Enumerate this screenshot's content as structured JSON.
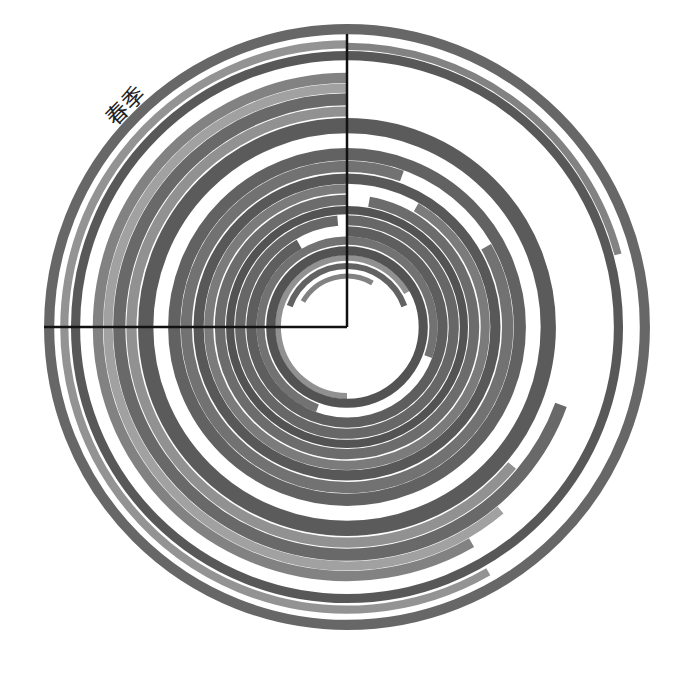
{
  "chart_data": {
    "type": "bar",
    "subtype": "radial-bar",
    "title": "",
    "angle_unit": "degrees",
    "angle_range": [
      0,
      360
    ],
    "direction": "clockwise",
    "start": "top",
    "radial_range": [
      0,
      30
    ],
    "angular_labels": [
      {
        "text": "春季",
        "angle": 315
      }
    ],
    "axes": {
      "vertical_axis_to_top": true,
      "horizontal_axis_to_left": true
    },
    "series": [
      {
        "name": "r1",
        "ring": 5,
        "width": 0.5,
        "start": 300,
        "end": 390,
        "gray": "#777777"
      },
      {
        "name": "r2",
        "ring": 6,
        "width": 0.6,
        "start": 290,
        "end": 430,
        "gray": "#555555"
      },
      {
        "name": "r3",
        "ring": 6.8,
        "width": 0.6,
        "start": 180,
        "end": 420,
        "gray": "#888888"
      },
      {
        "name": "r4",
        "ring": 7.5,
        "width": 0.9,
        "start": 0,
        "end": 360,
        "gray": "#444444"
      },
      {
        "name": "r5",
        "ring": 8.5,
        "width": 0.8,
        "start": 200,
        "end": 470,
        "gray": "#666666"
      },
      {
        "name": "r6",
        "ring": 9.4,
        "width": 1.0,
        "start": 0,
        "end": 330,
        "gray": "#505050"
      },
      {
        "name": "r7",
        "ring": 10.5,
        "width": 1.0,
        "start": 0,
        "end": 355,
        "gray": "#5a5a5a"
      },
      {
        "name": "r8",
        "ring": 11.5,
        "width": 0.8,
        "start": 0,
        "end": 360,
        "gray": "#444444"
      },
      {
        "name": "r9",
        "ring": 12.5,
        "width": 1.0,
        "start": 10,
        "end": 360,
        "gray": "#606060"
      },
      {
        "name": "r10",
        "ring": 13.6,
        "width": 0.9,
        "start": 30,
        "end": 360,
        "gray": "#707070"
      },
      {
        "name": "r11",
        "ring": 14.6,
        "width": 1.0,
        "start": 0,
        "end": 360,
        "gray": "#4a4a4a"
      },
      {
        "name": "r12",
        "ring": 15.8,
        "width": 1.1,
        "start": 60,
        "end": 380,
        "gray": "#666666"
      },
      {
        "name": "r13",
        "ring": 17.0,
        "width": 1.2,
        "start": 0,
        "end": 360,
        "gray": "#555555"
      },
      {
        "name": "r14",
        "ring": 19.8,
        "width": 1.5,
        "start": 0,
        "end": 360,
        "gray": "#4d4d4d"
      },
      {
        "name": "r15",
        "ring": 21.2,
        "width": 1.0,
        "start": 130,
        "end": 360,
        "gray": "#888888"
      },
      {
        "name": "r16",
        "ring": 22.4,
        "width": 1.2,
        "start": 110,
        "end": 360,
        "gray": "#5c5c5c"
      },
      {
        "name": "r17",
        "ring": 23.5,
        "width": 0.9,
        "start": 140,
        "end": 360,
        "gray": "#999999"
      },
      {
        "name": "r18",
        "ring": 24.5,
        "width": 1.0,
        "start": 150,
        "end": 360,
        "gray": "#777777"
      },
      {
        "name": "r19",
        "ring": 26.7,
        "width": 0.9,
        "start": 0,
        "end": 360,
        "gray": "#4a4a4a"
      },
      {
        "name": "r20",
        "ring": 27.6,
        "width": 0.7,
        "start": 0,
        "end": 75,
        "gray": "#777777"
      },
      {
        "name": "r21",
        "ring": 27.8,
        "width": 0.8,
        "start": 150,
        "end": 360,
        "gray": "#8a8a8a"
      },
      {
        "name": "r22",
        "ring": 29.3,
        "width": 1.0,
        "start": 0,
        "end": 360,
        "gray": "#5a5a5a"
      }
    ]
  }
}
